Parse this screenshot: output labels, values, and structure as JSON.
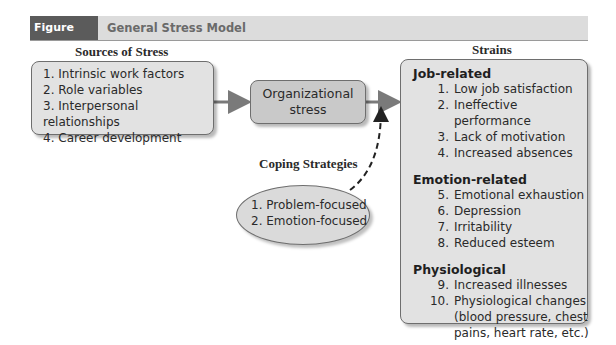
{
  "header": {
    "figure_label": "Figure 11.1",
    "title": "General Stress Model"
  },
  "sources": {
    "heading": "Sources of Stress",
    "items": [
      {
        "num": "1.",
        "label": "Intrinsic work factors"
      },
      {
        "num": "2.",
        "label": "Role variables"
      },
      {
        "num": "3.",
        "label": "Interpersonal relationships"
      },
      {
        "num": "4.",
        "label": "Career development"
      }
    ]
  },
  "center": {
    "line1": "Organizational",
    "line2": "stress"
  },
  "coping": {
    "heading": "Coping Strategies",
    "items": [
      {
        "num": "1.",
        "label": "Problem-focused"
      },
      {
        "num": "2.",
        "label": "Emotion-focused"
      }
    ]
  },
  "strains": {
    "heading": "Strains",
    "categories": [
      {
        "title": "Job-related",
        "items": [
          {
            "num": "1.",
            "label": "Low job satisfaction"
          },
          {
            "num": "2.",
            "label": "Ineffective performance"
          },
          {
            "num": "3.",
            "label": "Lack of motivation"
          },
          {
            "num": "4.",
            "label": "Increased absences"
          }
        ]
      },
      {
        "title": "Emotion-related",
        "items": [
          {
            "num": "5.",
            "label": "Emotional exhaustion"
          },
          {
            "num": "6.",
            "label": "Depression"
          },
          {
            "num": "7.",
            "label": "Irritability"
          },
          {
            "num": "8.",
            "label": "Reduced esteem"
          }
        ]
      },
      {
        "title": "Physiological",
        "items": [
          {
            "num": "9.",
            "label": "Increased illnesses"
          },
          {
            "num": "10.",
            "label": "Physiological changes (blood pressure, chest pains, heart rate, etc.)"
          }
        ]
      }
    ]
  },
  "colors": {
    "figure_label_bg": "#5b5b5b",
    "header_bg": "#dcdcdc",
    "box_fill": "#e2e2e2",
    "center_fill": "#c9c9c9",
    "arrow": "#7a7a7a"
  }
}
